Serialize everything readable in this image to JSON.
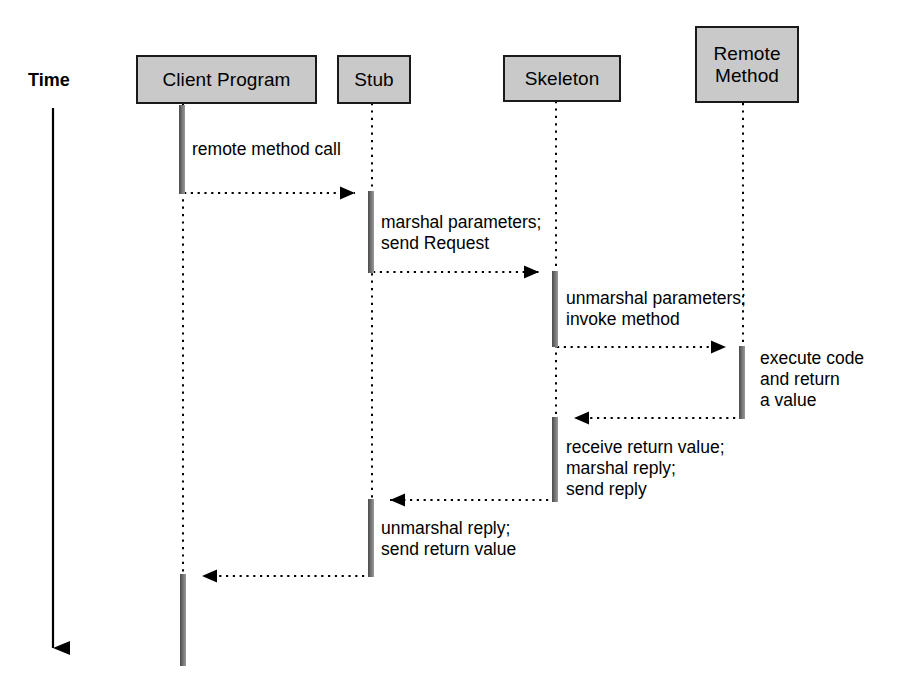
{
  "diagram": {
    "title_axis_label": "Time",
    "type": "sequence-diagram",
    "participants": [
      {
        "id": "client",
        "label": "Client Program"
      },
      {
        "id": "stub",
        "label": "Stub"
      },
      {
        "id": "skeleton",
        "label": "Skeleton"
      },
      {
        "id": "remote",
        "label": "Remote\nMethod"
      }
    ],
    "notes": [
      {
        "id": "note-remote-method-call",
        "text": "remote method call"
      },
      {
        "id": "note-marshal-parameters",
        "text": "marshal parameters;\nsend Request"
      },
      {
        "id": "note-unmarshal-parameters",
        "text": "unmarshal parameters;\ninvoke method"
      },
      {
        "id": "note-execute-code",
        "text": "execute code\nand return\na value"
      },
      {
        "id": "note-receive-return-value",
        "text": "receive return value;\nmarshal reply;\nsend reply"
      },
      {
        "id": "note-unmarshal-reply",
        "text": "unmarshal reply;\nsend return value"
      }
    ],
    "messages": [
      {
        "id": "msg-1",
        "from": "client",
        "to": "stub",
        "direction": "right"
      },
      {
        "id": "msg-2",
        "from": "stub",
        "to": "skeleton",
        "direction": "right"
      },
      {
        "id": "msg-3",
        "from": "skeleton",
        "to": "remote",
        "direction": "right"
      },
      {
        "id": "msg-4",
        "from": "remote",
        "to": "skeleton",
        "direction": "left"
      },
      {
        "id": "msg-5",
        "from": "skeleton",
        "to": "stub",
        "direction": "left"
      },
      {
        "id": "msg-6",
        "from": "stub",
        "to": "client",
        "direction": "left"
      }
    ],
    "colors": {
      "box_fill": "#c9c9c9",
      "box_border": "#1a1a1a",
      "line": "#000000",
      "activation": "#6f6f6f",
      "background": "#ffffff"
    }
  }
}
